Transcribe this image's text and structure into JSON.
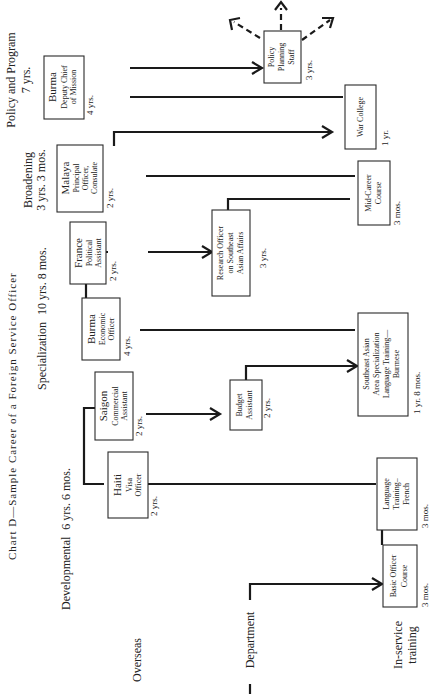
{
  "title": "Chart D—Sample Career of a Foreign Service Officer",
  "phases": [
    {
      "name": "Developmental",
      "duration": "6 yrs. 6 mos."
    },
    {
      "name": "Specialization",
      "duration": "10 yrs. 8 mos."
    },
    {
      "name": "Broadening",
      "duration": "3 yrs. 3 mos."
    },
    {
      "name": "Policy and Program",
      "duration": "7 yrs."
    }
  ],
  "tracks": {
    "overseas": "Overseas",
    "department": "Department",
    "in_service": [
      "In-service",
      "training"
    ]
  },
  "overseas_posts": [
    {
      "place": "Haiti",
      "role": [
        "Visa",
        "Officer"
      ],
      "duration": "2 yrs."
    },
    {
      "place": "Saigon",
      "role": [
        "Commercial",
        "Assistant"
      ],
      "duration": "2 yrs."
    },
    {
      "place": "Burma",
      "role": [
        "Economic",
        "Officer"
      ],
      "duration": "4 yrs."
    },
    {
      "place": "France",
      "role": [
        "Political",
        "Assistant"
      ],
      "duration": "2 yrs."
    },
    {
      "place": "Malaya",
      "role": [
        "Principal",
        "Officer,",
        "Consulate"
      ],
      "duration": "2 yrs."
    },
    {
      "place": "Burma",
      "role": [
        "Deputy Chief",
        "of Mission"
      ],
      "duration": "4 yrs."
    }
  ],
  "department_posts": [
    {
      "label": [
        "Budget",
        "Assistant"
      ],
      "duration": "2 yrs."
    },
    {
      "label": [
        "Research Officer",
        "on Southeast",
        "Asian Affairs"
      ],
      "duration": "3 yrs."
    },
    {
      "label": [
        "Policy",
        "Planning",
        "Staff"
      ],
      "duration": "3 yrs."
    }
  ],
  "training": [
    {
      "label": [
        "Basic Officer",
        "Course"
      ],
      "duration": "3 mos."
    },
    {
      "label": [
        "Language",
        "Training–",
        "French"
      ],
      "duration": "3 mos."
    },
    {
      "label": [
        "Southeast Asian",
        "Area Specialization",
        "Language Training—",
        "Burmese"
      ],
      "duration": "1 yr. 8 mos."
    },
    {
      "label": [
        "Mid-Career",
        "Course"
      ],
      "duration": "3 mos."
    },
    {
      "label": [
        "War College"
      ],
      "duration": "1 yr."
    }
  ]
}
